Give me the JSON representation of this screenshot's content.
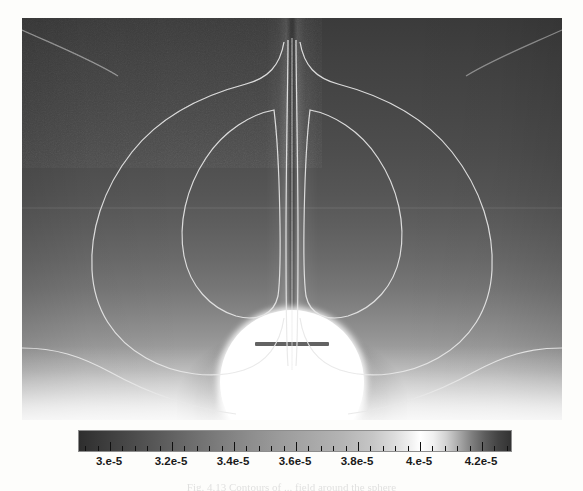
{
  "figure": {
    "kind": "scientific-contour-field-plot",
    "caption_partial": "Fig. 4.13  Contours of ... field around the sphere"
  },
  "chart_data": {
    "type": "heatmap",
    "title": "",
    "subtitle": "",
    "xlabel": "",
    "ylabel": "",
    "colormap": "grayscale-rainbow",
    "grid": false,
    "legend_position": "bottom",
    "colorbar": {
      "orientation": "horizontal",
      "vmin": 2.9e-05,
      "vmax": 4.3e-05,
      "tick_labels": [
        "3.e-5",
        "3.2e-5",
        "3.4e-5",
        "3.6e-5",
        "3.8e-5",
        "4.e-5",
        "4.2e-5"
      ],
      "tick_values": [
        3e-05,
        3.2e-05,
        3.4e-05,
        3.6e-05,
        3.8e-05,
        4e-05,
        4.2e-05
      ],
      "minor_ticks_per_interval": 4
    },
    "field_description": "Axisymmetric scalar field with a bright circular body at bottom centre, a narrow vertical plume rising along the symmetry axis, and a pair of mirrored recirculation cells marked by closed contour loops.",
    "features": [
      {
        "name": "white-sphere",
        "position": "bottom-center",
        "value_range": "saturated-high"
      },
      {
        "name": "central-plume",
        "position": "vertical-axis",
        "value_range": "low"
      },
      {
        "name": "left-recirculation-cell",
        "position": "upper-left",
        "value_range": "mid"
      },
      {
        "name": "right-recirculation-cell",
        "position": "upper-right",
        "value_range": "mid"
      },
      {
        "name": "hot-floor-layer",
        "position": "bottom-edge",
        "value_range": "high"
      }
    ],
    "contour_levels": [
      3.1e-05,
      3.3e-05,
      3.5e-05,
      3.7e-05,
      3.9e-05
    ],
    "axis_ranges": {
      "x": [
        -1,
        1
      ],
      "y": [
        0,
        1.5
      ]
    }
  },
  "colorbar_ticks": {
    "labels": [
      "3.e-5",
      "3.2e-5",
      "3.4e-5",
      "3.6e-5",
      "3.8e-5",
      "4.e-5",
      "4.2e-5"
    ]
  }
}
